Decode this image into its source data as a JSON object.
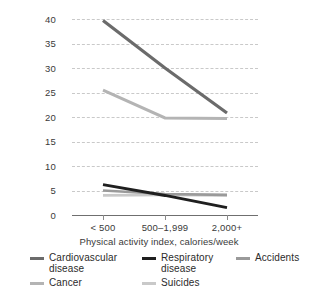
{
  "chart_data": {
    "type": "line",
    "title": "",
    "subtitle": "",
    "xlabel": "Physical activity index, calories/week",
    "ylabel": "Percent of total deaths",
    "categories": [
      "< 500",
      "500–1,999",
      "2,000+"
    ],
    "ylim": [
      0,
      40
    ],
    "yticks": [
      0,
      5,
      10,
      15,
      20,
      25,
      30,
      35,
      40
    ],
    "ytick_labels": [
      "0",
      "5",
      "10",
      "15",
      "20",
      "25",
      "30",
      "35",
      "40"
    ],
    "grid": "horizontal-dashed",
    "legend_position": "bottom",
    "series": [
      {
        "name": "Cardiovascular disease",
        "values": [
          39.7,
          30.0,
          20.8
        ],
        "color": "#6b6b6b",
        "width": 3.2
      },
      {
        "name": "Cancer",
        "values": [
          25.5,
          19.8,
          19.7
        ],
        "color": "#b4b4b4",
        "width": 3.0
      },
      {
        "name": "Respiratory disease",
        "values": [
          6.2,
          4.0,
          1.5
        ],
        "color": "#1f1f1f",
        "width": 3.0
      },
      {
        "name": "Accidents",
        "values": [
          5.0,
          4.3,
          4.1
        ],
        "color": "#9a9a9a",
        "width": 2.6
      },
      {
        "name": "Suicides",
        "values": [
          4.0,
          4.1,
          4.0
        ],
        "color": "#c9c9c9",
        "width": 2.6
      }
    ]
  },
  "axes": {
    "y_title": "Percent of total deaths",
    "x_title": "Physical activity index, calories/week",
    "y_labels": [
      "40",
      "35",
      "30",
      "25",
      "20",
      "15",
      "10",
      "5",
      "0"
    ],
    "x_labels": [
      "< 500",
      "500–1,999",
      "2,000+"
    ]
  },
  "legend": {
    "rows": [
      [
        {
          "label": "Cardiovascular disease",
          "color": "#6b6b6b",
          "name": "legend-cardiovascular-disease"
        },
        {
          "label": "Respiratory disease",
          "color": "#1f1f1f",
          "name": "legend-respiratory-disease"
        },
        {
          "label": "Accidents",
          "color": "#9a9a9a",
          "name": "legend-accidents"
        }
      ],
      [
        {
          "label": "Cancer",
          "color": "#b4b4b4",
          "name": "legend-cancer"
        },
        {
          "label": "Suicides",
          "color": "#c9c9c9",
          "name": "legend-suicides"
        }
      ]
    ]
  }
}
